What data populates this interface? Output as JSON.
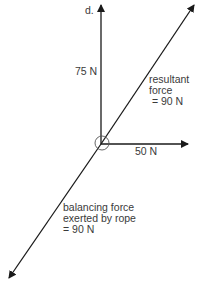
{
  "diagram": {
    "type": "force vector diagram",
    "origin": {
      "x": 101,
      "y": 144
    },
    "vectors": [
      {
        "id": "vertical",
        "label": "75 N",
        "tip": {
          "x": 101,
          "y": 4
        },
        "end_label": "d."
      },
      {
        "id": "horizontal",
        "label": "50 N",
        "tip": {
          "x": 188,
          "y": 144
        }
      },
      {
        "id": "resultant",
        "label_lines": [
          "resultant",
          "force",
          "= 90 N"
        ],
        "tip": {
          "x": 194,
          "y": 4
        }
      },
      {
        "id": "balancing",
        "label_lines": [
          "balancing force",
          "exerted by rope",
          "= 90 N"
        ],
        "tip": {
          "x": 9,
          "y": 278
        }
      }
    ]
  },
  "labels": {
    "d": "d.",
    "vertical": "75 N",
    "horizontal": "50 N",
    "resultant": "resultant\nforce\n = 90 N",
    "balancing": "balancing force\nexerted by rope\n= 90 N"
  },
  "colors": {
    "line": "#1a1a1a",
    "text": "#3a3a3a",
    "circle": "#555555"
  }
}
